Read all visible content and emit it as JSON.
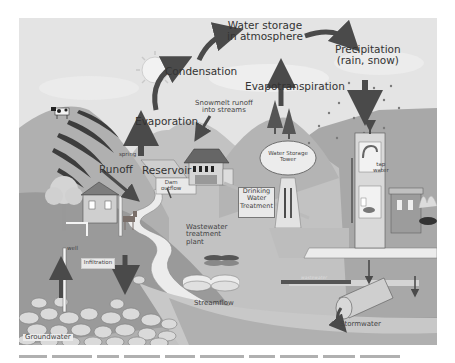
{
  "diagram": {
    "labels": {
      "water_storage_atmosphere": [
        "Water storage",
        "in atmosphere"
      ],
      "condensation": "Condensation",
      "precipitation": [
        "Precipitation",
        "(rain, snow)"
      ],
      "evapotranspiration": "Evapotranspiration",
      "evaporation": "Evaporation",
      "snowmelt": [
        "Snowmelt runoff",
        "into streams"
      ],
      "spring": "spring",
      "runoff": "Runoff",
      "reservoir": "Reservoir",
      "dam_outflow": [
        "Dam",
        "outflow"
      ],
      "water_storage_tower": [
        "Water Storage",
        "Tower"
      ],
      "drinking_water_treatment": [
        "Drinking",
        "Water",
        "Treatment"
      ],
      "tap_water": [
        "tap",
        "water"
      ],
      "wastewater_treatment_plant": [
        "Wastewater",
        "treatment",
        "plant"
      ],
      "wastewater_pipe": "wastewater",
      "well": "well",
      "infiltration": "Infiltration",
      "streamflow": "Streamflow",
      "groundwater": "Groundwater",
      "stormwater": "Stormwater"
    },
    "colors": {
      "sky": "#e4e4e4",
      "hill_light": "#b9b9b9",
      "hill_dark": "#8f8f8f",
      "arrow": "#4a4a4a",
      "stream": "#ececec",
      "ground": "#9a9a9a",
      "rocks": "#d8d8d8"
    }
  }
}
